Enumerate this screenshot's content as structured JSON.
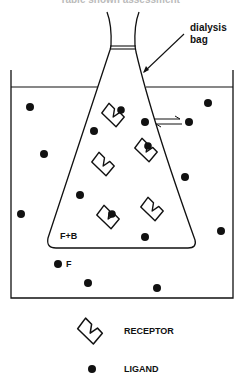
{
  "figure": {
    "top_caption": "Table shown assessment",
    "labels": {
      "dialysis_bag_line1": "dialysis",
      "dialysis_bag_line2": "bag",
      "inside_bag": "F+B",
      "outside_free": "F"
    },
    "legend": {
      "receptor_label": "RECEPTOR",
      "ligand_label": "LIGAND"
    },
    "colors": {
      "ink": "#111111",
      "background": "#ffffff"
    },
    "ligands_outside": [
      [
        29,
        106
      ],
      [
        43,
        154
      ],
      [
        21,
        214
      ],
      [
        58,
        264
      ],
      [
        88,
        283
      ],
      [
        157,
        287
      ],
      [
        208,
        102
      ],
      [
        218,
        122
      ],
      [
        185,
        177
      ],
      [
        220,
        231
      ],
      [
        145,
        237
      ]
    ],
    "ligands_inside": [
      [
        94,
        131
      ],
      [
        144,
        122
      ],
      [
        80,
        195
      ]
    ],
    "ligands_bound": [
      [
        120,
        110
      ],
      [
        148,
        148
      ],
      [
        111,
        215
      ]
    ],
    "receptors": [
      {
        "x": 113,
        "y": 115,
        "rot": -30
      },
      {
        "x": 148,
        "y": 148,
        "rot": -30
      },
      {
        "x": 103,
        "y": 165,
        "rot": -30
      },
      {
        "x": 107,
        "y": 215,
        "rot": -30
      },
      {
        "x": 151,
        "y": 207,
        "rot": -30
      }
    ]
  }
}
